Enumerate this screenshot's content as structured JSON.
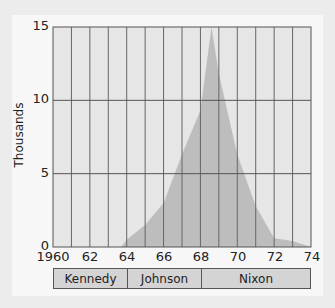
{
  "chart_data": {
    "type": "area",
    "title": "",
    "xlabel": "",
    "ylabel": "Thousands",
    "xlim": [
      1960,
      1974
    ],
    "ylim": [
      0,
      15
    ],
    "grid": true,
    "x": [
      1963.7,
      1964,
      1965,
      1966,
      1967,
      1968,
      1968.6,
      1969,
      1970,
      1971,
      1972,
      1973,
      1974
    ],
    "values": [
      0,
      0.5,
      1.5,
      3.0,
      6.3,
      9.3,
      15.0,
      11.8,
      6.3,
      2.8,
      0.6,
      0.4,
      0
    ],
    "x_tick_labels": [
      "1960",
      "62",
      "64",
      "66",
      "68",
      "70",
      "72",
      "74"
    ],
    "y_tick_labels": [
      "0",
      "5",
      "10",
      "15"
    ],
    "annotations": [
      {
        "label": "Kennedy",
        "from": 1960,
        "to": 1964
      },
      {
        "label": "Johnson",
        "from": 1964,
        "to": 1968
      },
      {
        "label": "Nixon",
        "from": 1968,
        "to": 1974
      }
    ]
  },
  "axis": {
    "ylabel": "Thousands",
    "yticks": [
      "0",
      "5",
      "10",
      "15"
    ],
    "xticks": [
      "1960",
      "62",
      "64",
      "66",
      "68",
      "70",
      "72",
      "74"
    ]
  },
  "presidents": [
    {
      "name": "Kennedy"
    },
    {
      "name": "Johnson"
    },
    {
      "name": "Nixon"
    }
  ],
  "colors": {
    "plot_bg": "#e6e6e6",
    "area_fill": "#bdbdbd",
    "grid": "#555555",
    "bar_fill": "#d4d4d4"
  }
}
